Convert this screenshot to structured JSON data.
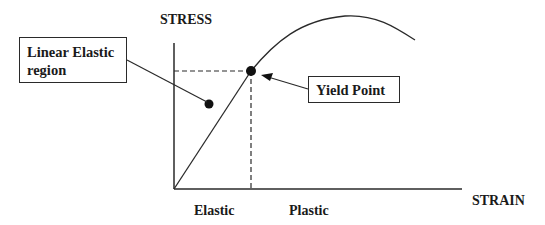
{
  "diagram": {
    "type": "stress-strain curve",
    "axes": {
      "y_label": "STRESS",
      "x_label": "STRAIN"
    },
    "regions": [
      {
        "label": "Elastic"
      },
      {
        "label": "Plastic"
      }
    ],
    "callouts": {
      "linear_elastic": {
        "line1": "Linear Elastic",
        "line2": "region"
      },
      "yield_point": {
        "label": "Yield Point"
      }
    },
    "colors": {
      "line": "#2a2a2a",
      "background": "#ffffff",
      "text": "#1a1a1a"
    }
  }
}
